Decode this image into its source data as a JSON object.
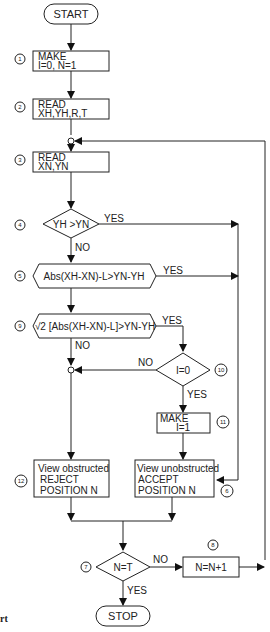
{
  "flowchart": {
    "start": "START",
    "stop": "STOP",
    "steps": {
      "s1": {
        "num": "1",
        "line1": "MAKE",
        "line2": "I=0, N=1"
      },
      "s2": {
        "num": "2",
        "line1": "READ",
        "line2": "XH,YH,R,T"
      },
      "s3": {
        "num": "3",
        "line1": "READ",
        "line2": "XN,YN"
      },
      "s4": {
        "num": "4",
        "text": "YH >YN"
      },
      "s5": {
        "num": "5",
        "text": "Abs(XH-XN)-L>YN-YH"
      },
      "s9": {
        "num": "9",
        "text": "√2 [Abs(XH-XN)-L]>YN-YH"
      },
      "s10": {
        "num": "10",
        "text": "I=0"
      },
      "s11": {
        "num": "11",
        "line1": "MAKE",
        "line2": "I=1"
      },
      "s12": {
        "num": "12",
        "line1": "View obstructed",
        "line2": "REJECT",
        "line3": "POSITION  N"
      },
      "s6": {
        "num": "6",
        "line1": "View unobstructed",
        "line2": "ACCEPT",
        "line3": "POSITION  N"
      },
      "s7": {
        "num": "7",
        "text": "N=T"
      },
      "s8": {
        "num": "8",
        "text": "N=N+1"
      }
    },
    "labels": {
      "yes": "YES",
      "no": "NO"
    }
  },
  "caption": "rt"
}
